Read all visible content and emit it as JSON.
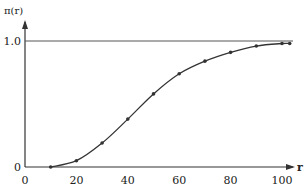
{
  "chart_data": {
    "type": "line",
    "title": "",
    "xlabel": "r",
    "ylabel": "π(r)",
    "x": [
      10,
      20,
      30,
      40,
      50,
      60,
      70,
      80,
      90,
      100,
      103
    ],
    "series": [
      {
        "name": "π(r)",
        "values": [
          0.0,
          0.05,
          0.19,
          0.38,
          0.58,
          0.74,
          0.84,
          0.91,
          0.96,
          0.98,
          0.98
        ]
      }
    ],
    "xticks": [
      "0",
      "20",
      "40",
      "60",
      "80",
      "100"
    ],
    "yticks": [
      "0",
      "1.0"
    ],
    "xlim": [
      0,
      105
    ],
    "ylim": [
      0,
      1.0
    ],
    "reference_line": {
      "y": 1.0
    },
    "grid": false,
    "legend": null
  },
  "colors": {
    "line": "#333333",
    "axis": "#333333",
    "reference": "#555555"
  }
}
